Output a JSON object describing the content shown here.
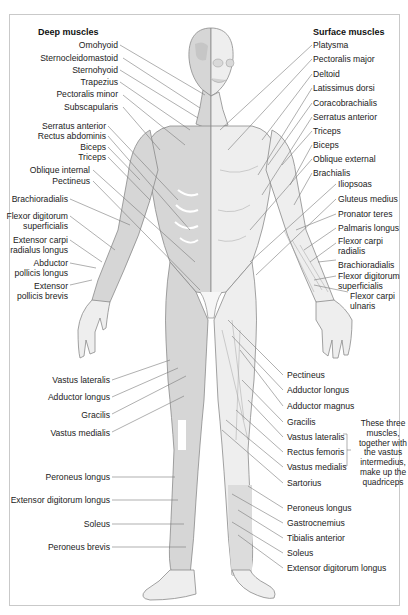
{
  "deep": {
    "title": "Deep muscles",
    "labels": [
      "Omohyoid",
      "Sternocleidomastoid",
      "Sternohyoid",
      "Trapezius",
      "Pectoralis minor",
      "Subscapularis",
      "Serratus anterior",
      "Rectus abdominis",
      "Biceps",
      "Triceps",
      "Oblique internal",
      "Pectineus",
      "Brachioradialis",
      "Flexor digitorum superficialis",
      "Extensor carpi radialus longus",
      "Abductor pollicis longus",
      "Extensor pollicis brevis",
      "Vastus lateralis",
      "Adductor longus",
      "Gracilis",
      "Vastus medialis",
      "Peroneus longus",
      "Extensor digitorum longus",
      "Soleus",
      "Peroneus brevis"
    ]
  },
  "surface": {
    "title": "Surface muscles",
    "labels": [
      "Platysma",
      "Pectoralis major",
      "Deltoid",
      "Latissimus dorsi",
      "Coracobrachialis",
      "Serratus anterior",
      "Triceps",
      "Biceps",
      "Oblique external",
      "Brachialis",
      "Iliopsoas",
      "Gluteus medius",
      "Pronator teres",
      "Palmaris longus",
      "Flexor carpi radialis",
      "Brachioradialis",
      "Flexor digitorum superficialis",
      "Flexor carpi ulnaris",
      "Pectineus",
      "Adductor longus",
      "Adductor magnus",
      "Gracilis",
      "Vastus lateralis",
      "Rectus femoris",
      "Vastus medialis",
      "Sartorius",
      "Peroneus longus",
      "Gastrocnemius",
      "Tibialis anterior",
      "Soleus",
      "Extensor digitorum longus"
    ]
  },
  "split_labels": {
    "flexor_dig_a": "Flexor digitorum",
    "flexor_dig_b": "superficialis",
    "ext_carpi_a": "Extensor carpi",
    "ext_carpi_b": "radialus longus",
    "abd_a": "Abductor",
    "abd_b": "pollicis longus",
    "ext_pol_a": "Extensor",
    "ext_pol_b": "pollicis brevis",
    "fcr_a": "Flexor carpi",
    "fcr_b": "radialis",
    "fds_a": "Flexor digitorum",
    "fds_b": "superficialis",
    "fcu_a": "Flexor carpi",
    "fcu_b": "ulnaris"
  },
  "quadriceps_note": {
    "lines": [
      "These three",
      "muscles,",
      "together with",
      "the vastus",
      "intermedius,",
      "make up the",
      "quadriceps"
    ]
  },
  "colors": {
    "deep_fill": "#d6d6d6",
    "surface_fill": "#ececec",
    "outline": "#8a8a8a",
    "leader": "#7a7a7a",
    "panel_border": "#c9c9c9"
  }
}
